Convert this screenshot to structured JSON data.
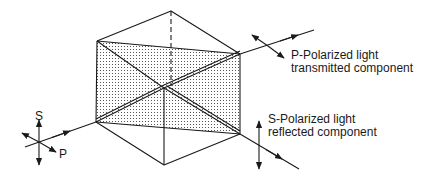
{
  "diagram": {
    "input_axes": {
      "s_label": "S",
      "p_label": "P"
    },
    "transmitted": {
      "line1": "P-Polarized light",
      "line2": "transmitted component"
    },
    "reflected": {
      "line1": "S-Polarized light",
      "line2": "reflected component"
    },
    "colors": {
      "stroke": "#1a1a1a",
      "dot": "#555555",
      "background": "#ffffff"
    }
  }
}
